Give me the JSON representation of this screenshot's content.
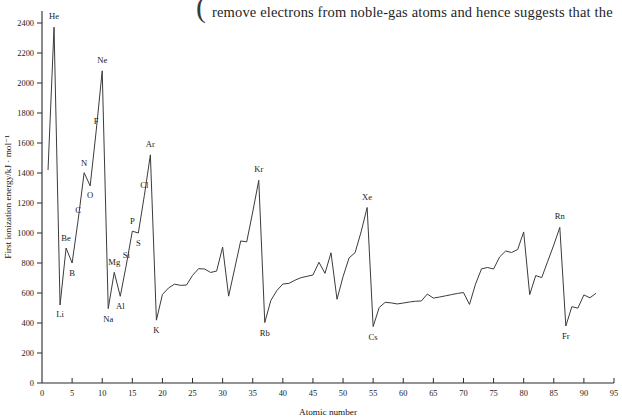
{
  "page_text": {
    "clipped_line_above": "electrons farther from the nucleus than the  ",
    "visible_line": "remove electrons from noble-gas atoms and hence suggests that the",
    "brace_glyph": "("
  },
  "chart_data": {
    "type": "line",
    "title": "",
    "xlabel": "Atomic number",
    "ylabel": "First ionization energy/kJ · mol⁻¹",
    "xlim": [
      0,
      95
    ],
    "ylim": [
      0,
      2500
    ],
    "xticks": [
      0,
      5,
      10,
      15,
      20,
      25,
      30,
      35,
      40,
      45,
      50,
      55,
      60,
      65,
      70,
      75,
      80,
      85,
      90,
      95
    ],
    "yticks": [
      0,
      200,
      400,
      600,
      800,
      1000,
      1200,
      1400,
      1600,
      1800,
      2000,
      2200,
      2400
    ],
    "grid": false,
    "legend": null,
    "line_color": "#3b3b3b",
    "x": [
      1,
      2,
      3,
      4,
      5,
      6,
      7,
      8,
      9,
      10,
      11,
      12,
      13,
      14,
      15,
      16,
      17,
      18,
      19,
      20,
      21,
      22,
      23,
      24,
      25,
      26,
      27,
      28,
      29,
      30,
      31,
      32,
      33,
      34,
      35,
      36,
      37,
      38,
      39,
      40,
      41,
      42,
      43,
      44,
      45,
      46,
      47,
      48,
      49,
      50,
      51,
      52,
      53,
      54,
      55,
      56,
      57,
      58,
      59,
      60,
      61,
      62,
      63,
      64,
      65,
      66,
      67,
      68,
      69,
      70,
      71,
      72,
      73,
      74,
      75,
      76,
      77,
      78,
      79,
      80,
      81,
      82,
      83,
      84,
      85,
      86,
      87,
      88,
      89,
      90,
      91,
      92
    ],
    "y": [
      1420,
      2372,
      520,
      900,
      800,
      1086,
      1402,
      1314,
      1681,
      2081,
      496,
      738,
      578,
      787,
      1012,
      1000,
      1251,
      1521,
      419,
      590,
      633,
      659,
      651,
      653,
      717,
      762,
      760,
      737,
      746,
      906,
      579,
      762,
      947,
      941,
      1140,
      1351,
      403,
      550,
      616,
      660,
      664,
      685,
      702,
      711,
      720,
      805,
      731,
      868,
      558,
      709,
      834,
      869,
      1008,
      1170,
      376,
      503,
      538,
      534,
      527,
      533,
      540,
      545,
      547,
      593,
      566,
      573,
      581,
      589,
      597,
      603,
      524,
      659,
      761,
      770,
      760,
      840,
      880,
      870,
      890,
      1007,
      589,
      716,
      703,
      812,
      920,
      1037,
      380,
      509,
      499,
      587,
      568,
      598
    ],
    "annotations": [
      {
        "label": "He",
        "atomic_number": 2,
        "value": 2372,
        "dy": -8
      },
      {
        "label": "Li",
        "atomic_number": 3,
        "value": 520,
        "dy": 12
      },
      {
        "label": "Be",
        "atomic_number": 4,
        "value": 900,
        "dy": -7
      },
      {
        "label": "B",
        "atomic_number": 5,
        "value": 800,
        "dy": 13
      },
      {
        "label": "C",
        "atomic_number": 6,
        "value": 1086,
        "dy": -7
      },
      {
        "label": "N",
        "atomic_number": 7,
        "value": 1402,
        "dy": -7
      },
      {
        "label": "O",
        "atomic_number": 8,
        "value": 1314,
        "dy": 12
      },
      {
        "label": "F",
        "atomic_number": 9,
        "value": 1681,
        "dy": -7
      },
      {
        "label": "Ne",
        "atomic_number": 10,
        "value": 2081,
        "dy": -8
      },
      {
        "label": "Na",
        "atomic_number": 11,
        "value": 496,
        "dy": 13
      },
      {
        "label": "Mg",
        "atomic_number": 12,
        "value": 738,
        "dy": -7
      },
      {
        "label": "Al",
        "atomic_number": 13,
        "value": 578,
        "dy": 13
      },
      {
        "label": "Si",
        "atomic_number": 14,
        "value": 787,
        "dy": -7
      },
      {
        "label": "P",
        "atomic_number": 15,
        "value": 1012,
        "dy": -7
      },
      {
        "label": "S",
        "atomic_number": 16,
        "value": 1000,
        "dy": 13
      },
      {
        "label": "Cl",
        "atomic_number": 17,
        "value": 1251,
        "dy": -7
      },
      {
        "label": "Ar",
        "atomic_number": 18,
        "value": 1521,
        "dy": -8
      },
      {
        "label": "K",
        "atomic_number": 19,
        "value": 419,
        "dy": 13
      },
      {
        "label": "Kr",
        "atomic_number": 36,
        "value": 1351,
        "dy": -8
      },
      {
        "label": "Rb",
        "atomic_number": 37,
        "value": 403,
        "dy": 13
      },
      {
        "label": "Xe",
        "atomic_number": 54,
        "value": 1170,
        "dy": -8
      },
      {
        "label": "Cs",
        "atomic_number": 55,
        "value": 376,
        "dy": 13
      },
      {
        "label": "Rn",
        "atomic_number": 86,
        "value": 1037,
        "dy": -8
      },
      {
        "label": "Fr",
        "atomic_number": 87,
        "value": 380,
        "dy": 13
      }
    ]
  }
}
